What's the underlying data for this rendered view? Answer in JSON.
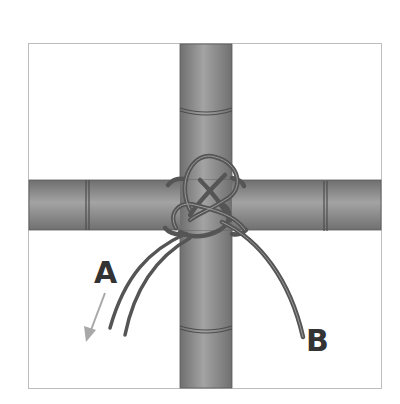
{
  "diagram": {
    "labels": {
      "a": "A",
      "b": "B"
    },
    "colors": {
      "background": "#ffffff",
      "frame": "#bdbdbd",
      "bamboo_light": "#a6a6a6",
      "bamboo_mid": "#8c8c8c",
      "bamboo_dark": "#6f6f6f",
      "bamboo_outline": "#555555",
      "cord": "#5a5a5a",
      "cord_highlight": "#9a9a9a",
      "arrow": "#a8a8a8",
      "label": "#333333"
    },
    "elements": [
      {
        "name": "vertical-bamboo-pole",
        "nodes": 2
      },
      {
        "name": "horizontal-bamboo-pole",
        "nodes": 2
      },
      {
        "name": "decorative-knot",
        "at": "intersection"
      },
      {
        "name": "cord-end-a",
        "direction": "pull down-left"
      },
      {
        "name": "cord-end-b",
        "direction": "hanging down-right"
      }
    ]
  }
}
